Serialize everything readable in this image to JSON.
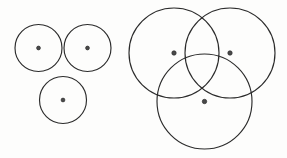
{
  "figure": {
    "background_color": "#fdfdfc",
    "stroke_color": "#2b2b2b",
    "dot_fill_color": "#4a4a4a",
    "canvas": {
      "width": 287,
      "height": 158
    },
    "groups": [
      {
        "name": "tangent-circles-group",
        "label": "Three mutually tangent circles",
        "circles": [
          {
            "name": "tangent-circle-top-left",
            "cx": 38.5,
            "cy": 48.0,
            "r": 23.5,
            "dot": true,
            "dot_r": 1.9
          },
          {
            "name": "tangent-circle-top-right",
            "cx": 87.5,
            "cy": 48.0,
            "r": 23.5,
            "dot": true,
            "dot_r": 1.9
          },
          {
            "name": "tangent-circle-bottom",
            "cx": 63.0,
            "cy": 100.0,
            "r": 23.5,
            "dot": true,
            "dot_r": 1.9
          }
        ]
      },
      {
        "name": "overlapping-circles-group",
        "label": "Three overlapping circles through each other's centers",
        "circles": [
          {
            "name": "overlap-circle-top-left",
            "cx": 174.0,
            "cy": 53.0,
            "r": 45.0,
            "dot": true,
            "dot_r": 2.2
          },
          {
            "name": "overlap-circle-top-right",
            "cx": 230.0,
            "cy": 53.0,
            "r": 45.0,
            "dot": true,
            "dot_r": 2.2
          },
          {
            "name": "overlap-circle-bottom",
            "cx": 204.5,
            "cy": 101.5,
            "r": 47.5,
            "dot": true,
            "dot_r": 2.2
          }
        ]
      }
    ]
  }
}
